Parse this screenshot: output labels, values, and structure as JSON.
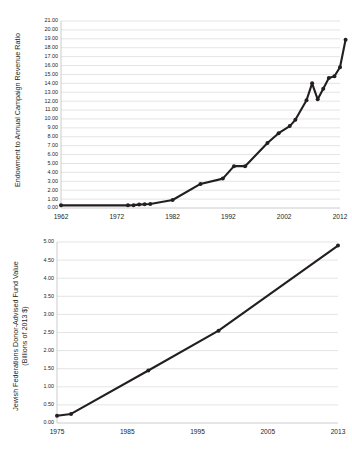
{
  "page": {
    "background": "#ffffff",
    "line_color": "#231f20",
    "grid_color": "#d9d9d9"
  },
  "chart_data": [
    {
      "id": "endowment-ratio",
      "type": "line",
      "title": "",
      "xlabel": "",
      "ylabel": "Endowment to Annual Campaign Revenue Ratio",
      "xlim": [
        1962,
        2013
      ],
      "ylim": [
        0.0,
        21.0
      ],
      "ytick_step": 1.0,
      "grid": true,
      "legend": "none",
      "xticks": [
        1962,
        1972,
        1982,
        1992,
        2002,
        2012
      ],
      "xtick_labels": [
        "1962",
        "1972",
        "1982",
        "1992",
        "2002",
        "2012"
      ],
      "yticks": [
        0,
        1,
        2,
        3,
        4,
        5,
        6,
        7,
        8,
        9,
        10,
        11,
        12,
        13,
        14,
        15,
        16,
        17,
        18,
        19,
        20,
        21
      ],
      "ytick_labels": [
        "0.00",
        "1.00",
        "2.00",
        "3.00",
        "4.00",
        "5.00",
        "6.00",
        "7.00",
        "8.00",
        "9.00",
        "10.00",
        "11.00",
        "12.00",
        "13.00",
        "14.00",
        "15.00",
        "16.00",
        "17.00",
        "18.00",
        "19.00",
        "20.00",
        "21.00"
      ],
      "x": [
        1962,
        1974,
        1975,
        1976,
        1977,
        1978,
        1982,
        1987,
        1991,
        1993,
        1995,
        1999,
        2001,
        2003,
        2004,
        2006,
        2007,
        2008,
        2009,
        2010,
        2011,
        2012,
        2013
      ],
      "values": [
        0.3,
        0.3,
        0.32,
        0.38,
        0.42,
        0.45,
        0.9,
        2.7,
        3.3,
        4.7,
        4.7,
        7.3,
        8.4,
        9.2,
        9.9,
        12.1,
        14.0,
        12.2,
        13.4,
        14.6,
        14.8,
        15.8,
        18.9
      ],
      "markers": [
        1962,
        1974,
        1975,
        1976,
        1977,
        1978,
        1982,
        1987,
        1991,
        1993,
        1995,
        1999,
        2001,
        2003,
        2004,
        2006,
        2007,
        2008,
        2009,
        2010,
        2011,
        2012,
        2013
      ]
    },
    {
      "id": "donor-advised-fund",
      "type": "line",
      "title": "",
      "xlabel": "",
      "ylabel": "Jewish Federations Donor-Advised Fund Value",
      "ylabel_line2": "(Billions of 2013 $)",
      "ylim": [
        0.0,
        5.0
      ],
      "ytick_step": 0.5,
      "grid": true,
      "legend": "none",
      "xticks": [
        1975,
        1985,
        1995,
        2005,
        2013
      ],
      "xtick_labels": [
        "1975",
        "1985",
        "1995",
        "2005",
        "2013"
      ],
      "yticks": [
        0,
        0.5,
        1.0,
        1.5,
        2.0,
        2.5,
        3.0,
        3.5,
        4.0,
        4.5,
        5.0
      ],
      "ytick_labels": [
        "0.00",
        "0.50",
        "1.00",
        "1.50",
        "2.00",
        "2.50",
        "3.00",
        "3.50",
        "4.00",
        "4.50",
        "5.00"
      ],
      "x": [
        1975,
        1977,
        1988,
        1998,
        2013
      ],
      "values": [
        0.2,
        0.25,
        1.45,
        2.55,
        4.9
      ],
      "markers": [
        1975,
        1977,
        1988,
        1998,
        2013
      ]
    }
  ]
}
